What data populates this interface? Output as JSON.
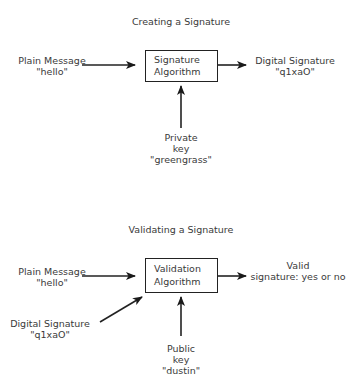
{
  "creating": {
    "title": "Creating a Signature",
    "box": {
      "line1": "Signature",
      "line2": "Algorithm"
    },
    "input_message": {
      "line1": "Plain Message",
      "line2": "\"hello\""
    },
    "output": {
      "line1": "Digital Signature",
      "line2": "\"q1xaO\""
    },
    "key": {
      "line1": "Private",
      "line2": "key",
      "line3": "\"greengrass\""
    }
  },
  "validating": {
    "title": "Validating a Signature",
    "box": {
      "line1": "Validation",
      "line2": "Algorithm"
    },
    "input_message": {
      "line1": "Plain Message",
      "line2": "\"hello\""
    },
    "input_signature": {
      "line1": "Digital Signature",
      "line2": "\"q1xaO\""
    },
    "output": {
      "line1": "Valid",
      "line2": "signature: yes or no"
    },
    "key": {
      "line1": "Public",
      "line2": "key",
      "line3": "\"dustin\""
    }
  },
  "colors": {
    "line": "#222222",
    "text": "#3a3a3a",
    "background": "#ffffff"
  }
}
